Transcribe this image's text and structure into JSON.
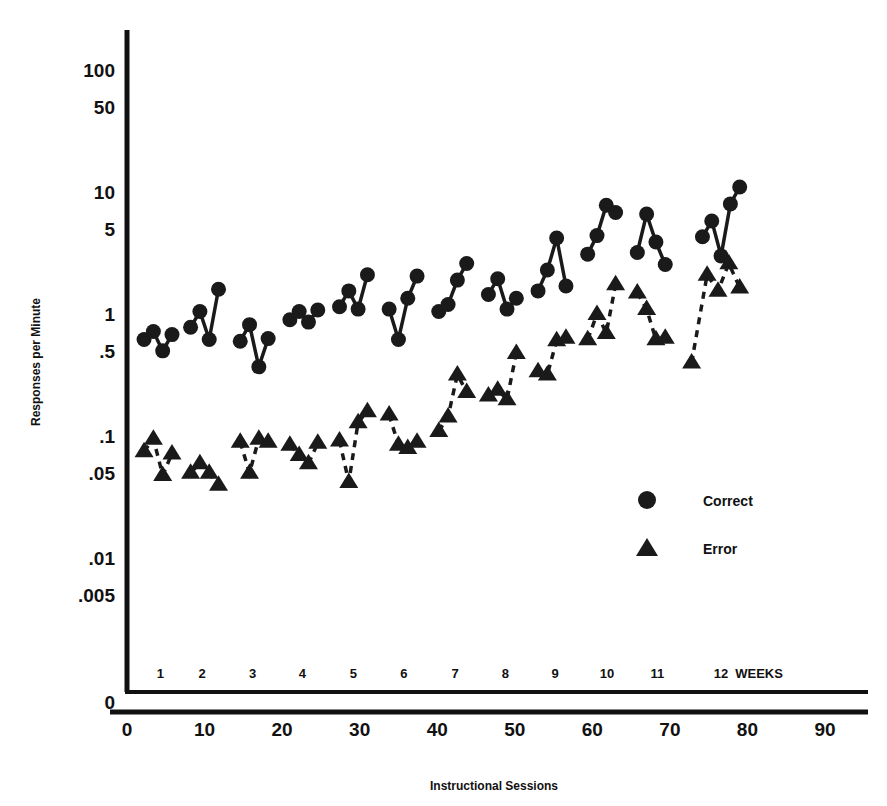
{
  "chart_data": {
    "type": "scatter",
    "title": "",
    "xlabel": "Instructional Sessions",
    "ylabel": "Responses per Minute",
    "yscale": "log",
    "ylim": [
      0.004,
      200
    ],
    "xlim": [
      0,
      94
    ],
    "grid": false,
    "legend_position": "inside-right",
    "y_ticks": [
      {
        "value": 100,
        "label": "100"
      },
      {
        "value": 50,
        "label": "50"
      },
      {
        "value": 10,
        "label": "10"
      },
      {
        "value": 5,
        "label": "5"
      },
      {
        "value": 1,
        "label": "1"
      },
      {
        "value": 0.5,
        "label": ".5"
      },
      {
        "value": 0.1,
        "label": ".1"
      },
      {
        "value": 0.05,
        "label": ".05"
      },
      {
        "value": 0.01,
        "label": ".01"
      },
      {
        "value": 0.005,
        "label": ".005"
      }
    ],
    "zero_label": "0",
    "x_ticks": [
      {
        "value": 0,
        "label": "0"
      },
      {
        "value": 10,
        "label": "10"
      },
      {
        "value": 20,
        "label": "20"
      },
      {
        "value": 30,
        "label": "30"
      },
      {
        "value": 40,
        "label": "40"
      },
      {
        "value": 50,
        "label": "50"
      },
      {
        "value": 60,
        "label": "60"
      },
      {
        "value": 70,
        "label": "70"
      },
      {
        "value": 80,
        "label": "80"
      },
      {
        "value": 90,
        "label": "90"
      }
    ],
    "week_axis_suffix": "WEEKS",
    "week_ticks": [
      {
        "value": 4.3,
        "label": "1"
      },
      {
        "value": 9.7,
        "label": "2"
      },
      {
        "value": 16.2,
        "label": "3"
      },
      {
        "value": 22.6,
        "label": "4"
      },
      {
        "value": 29.2,
        "label": "5"
      },
      {
        "value": 35.7,
        "label": "6"
      },
      {
        "value": 42.3,
        "label": "7"
      },
      {
        "value": 48.8,
        "label": "8"
      },
      {
        "value": 55.2,
        "label": "9"
      },
      {
        "value": 61.9,
        "label": "10"
      },
      {
        "value": 68.4,
        "label": "11"
      },
      {
        "value": 76.6,
        "label": "12"
      }
    ],
    "series": [
      {
        "name": "Correct",
        "marker": "circle",
        "line": "solid",
        "color": "#1a1a1a",
        "groups": [
          {
            "week": 1,
            "points": [
              [
                2.2,
                0.62
              ],
              [
                3.4,
                0.72
              ],
              [
                4.6,
                0.5
              ],
              [
                5.8,
                0.68
              ]
            ]
          },
          {
            "week": 2,
            "points": [
              [
                8.2,
                0.78
              ],
              [
                9.4,
                1.05
              ],
              [
                10.6,
                0.62
              ],
              [
                11.8,
                1.6
              ]
            ]
          },
          {
            "week": 3,
            "points": [
              [
                14.6,
                0.6
              ],
              [
                15.8,
                0.82
              ],
              [
                17.0,
                0.37
              ],
              [
                18.2,
                0.63
              ]
            ]
          },
          {
            "week": 4,
            "points": [
              [
                21.0,
                0.9
              ],
              [
                22.2,
                1.05
              ],
              [
                23.4,
                0.86
              ],
              [
                24.6,
                1.08
              ]
            ]
          },
          {
            "week": 5,
            "points": [
              [
                27.4,
                1.15
              ],
              [
                28.6,
                1.55
              ],
              [
                29.8,
                1.1
              ],
              [
                31.0,
                2.1
              ]
            ]
          },
          {
            "week": 6,
            "points": [
              [
                33.8,
                1.1
              ],
              [
                35.0,
                0.62
              ],
              [
                36.2,
                1.35
              ],
              [
                37.4,
                2.05
              ]
            ]
          },
          {
            "week": 7,
            "points": [
              [
                40.2,
                1.05
              ],
              [
                41.4,
                1.2
              ],
              [
                42.6,
                1.9
              ],
              [
                43.8,
                2.6
              ]
            ]
          },
          {
            "week": 8,
            "points": [
              [
                46.6,
                1.45
              ],
              [
                47.8,
                1.95
              ],
              [
                49.0,
                1.1
              ],
              [
                50.2,
                1.35
              ]
            ]
          },
          {
            "week": 9,
            "points": [
              [
                53.0,
                1.55
              ],
              [
                54.2,
                2.3
              ],
              [
                55.4,
                4.2
              ],
              [
                56.6,
                1.7
              ]
            ]
          },
          {
            "week": 10,
            "points": [
              [
                59.4,
                3.1
              ],
              [
                60.6,
                4.4
              ],
              [
                61.8,
                7.8
              ],
              [
                63.0,
                6.8
              ]
            ]
          },
          {
            "week": 11,
            "points": [
              [
                65.8,
                3.2
              ],
              [
                67.0,
                6.6
              ],
              [
                68.2,
                3.9
              ],
              [
                69.4,
                2.55
              ]
            ]
          },
          {
            "week": 12,
            "points": [
              [
                74.2,
                4.3
              ],
              [
                75.4,
                5.8
              ],
              [
                76.6,
                3.0
              ],
              [
                77.8,
                8.0
              ]
            ],
            "extra": [
              [
                79.0,
                11.0
              ]
            ]
          }
        ]
      },
      {
        "name": "Error",
        "marker": "triangle",
        "line": "dashed",
        "color": "#1a1a1a",
        "groups": [
          {
            "week": 1,
            "points": [
              [
                2.2,
                0.075
              ],
              [
                3.4,
                0.095
              ],
              [
                4.6,
                0.048
              ],
              [
                5.8,
                0.072
              ]
            ]
          },
          {
            "week": 2,
            "points": [
              [
                8.2,
                0.05
              ],
              [
                9.4,
                0.06
              ],
              [
                10.6,
                0.05
              ],
              [
                11.8,
                0.04
              ]
            ]
          },
          {
            "week": 3,
            "points": [
              [
                14.6,
                0.09
              ],
              [
                15.8,
                0.05
              ],
              [
                17.0,
                0.095
              ],
              [
                18.2,
                0.09
              ]
            ]
          },
          {
            "week": 4,
            "points": [
              [
                21.0,
                0.085
              ],
              [
                22.2,
                0.07
              ],
              [
                23.4,
                0.06
              ],
              [
                24.6,
                0.088
              ]
            ]
          },
          {
            "week": 5,
            "points": [
              [
                27.4,
                0.092
              ],
              [
                28.6,
                0.042
              ],
              [
                29.8,
                0.13
              ],
              [
                31.0,
                0.16
              ]
            ]
          },
          {
            "week": 6,
            "points": [
              [
                33.8,
                0.15
              ],
              [
                35.0,
                0.085
              ],
              [
                36.2,
                0.08
              ],
              [
                37.4,
                0.09
              ]
            ]
          },
          {
            "week": 7,
            "points": [
              [
                40.2,
                0.11
              ],
              [
                41.4,
                0.145
              ],
              [
                42.6,
                0.32
              ],
              [
                43.8,
                0.23
              ]
            ]
          },
          {
            "week": 8,
            "points": [
              [
                46.6,
                0.215
              ],
              [
                47.8,
                0.24
              ],
              [
                49.0,
                0.2
              ],
              [
                50.2,
                0.48
              ]
            ]
          },
          {
            "week": 9,
            "points": [
              [
                53.0,
                0.34
              ],
              [
                54.2,
                0.32
              ],
              [
                55.4,
                0.61
              ],
              [
                56.6,
                0.64
              ]
            ]
          },
          {
            "week": 10,
            "points": [
              [
                59.4,
                0.62
              ],
              [
                60.6,
                1.0
              ],
              [
                61.8,
                0.7
              ],
              [
                63.0,
                1.75
              ]
            ]
          },
          {
            "week": 11,
            "points": [
              [
                65.8,
                1.5
              ],
              [
                67.0,
                1.1
              ],
              [
                68.2,
                0.62
              ],
              [
                69.4,
                0.64
              ]
            ]
          },
          {
            "week": 12,
            "points": [
              [
                72.8,
                0.4
              ],
              [
                74.8,
                2.1
              ],
              [
                76.2,
                1.55
              ],
              [
                77.6,
                2.6
              ],
              [
                79.0,
                1.65
              ]
            ]
          }
        ]
      }
    ],
    "legend": [
      {
        "label": "Correct",
        "marker": "circle"
      },
      {
        "label": "Error",
        "marker": "triangle"
      }
    ]
  }
}
